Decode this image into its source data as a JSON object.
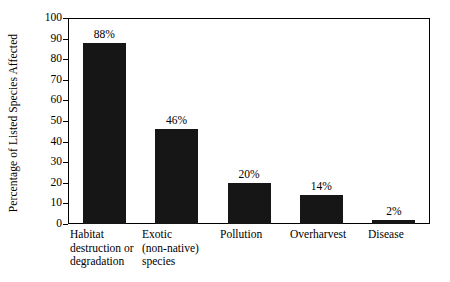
{
  "chart_data": {
    "type": "bar",
    "title": "",
    "xlabel": "",
    "ylabel": "Percentage of Listed Species Affected",
    "ylim": [
      0,
      100
    ],
    "ytick_values": [
      0,
      10,
      20,
      30,
      40,
      50,
      60,
      70,
      80,
      90,
      100
    ],
    "ytick_labels": [
      "0",
      "10",
      "20",
      "30",
      "40",
      "50",
      "60",
      "70",
      "80",
      "90",
      "100"
    ],
    "grid": false,
    "legend": "none",
    "bar_color": "#161616",
    "axis_color": "#000000",
    "background_color": "#ffffff",
    "categories": [
      "Habitat destruction or degradation",
      "Exotic (non-native) species",
      "Pollution",
      "Overharvest",
      "Disease"
    ],
    "category_label_lines": [
      [
        "Habitat",
        "destruction or",
        "degradation"
      ],
      [
        "Exotic",
        "(non-native)",
        "species"
      ],
      [
        "Pollution"
      ],
      [
        "Overharvest"
      ],
      [
        "Disease"
      ]
    ],
    "values": [
      88,
      46,
      20,
      14,
      2
    ],
    "data_labels": [
      "88%",
      "46%",
      "20%",
      "14%",
      "2%"
    ]
  }
}
